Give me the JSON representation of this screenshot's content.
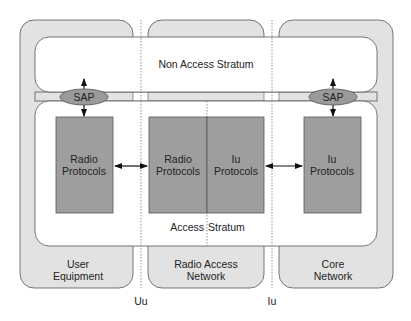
{
  "diagram": {
    "colors": {
      "column_fill": "#e2e2e2",
      "box_fill": "#9e9e9e",
      "sap_fill": "#9a9a9a",
      "stroke": "#555555",
      "white": "#ffffff"
    },
    "strata": {
      "non_access": "Non Access Stratum",
      "access_left": "Access",
      "access_right": "Stratum"
    },
    "columns": [
      {
        "line1": "User",
        "line2": "Equipment"
      },
      {
        "line1": "Radio Access",
        "line2": "Network"
      },
      {
        "line1": "Core",
        "line2": "Network"
      }
    ],
    "boxes": [
      {
        "line1": "Radio",
        "line2": "Protocols"
      },
      {
        "line1": "Radio",
        "line2": "Protocols"
      },
      {
        "line1": "Iu",
        "line2": "Protocols"
      },
      {
        "line1": "Iu",
        "line2": "Protocols"
      }
    ],
    "sap": [
      "SAP",
      "SAP"
    ],
    "interfaces": [
      "Uu",
      "Iu"
    ]
  }
}
